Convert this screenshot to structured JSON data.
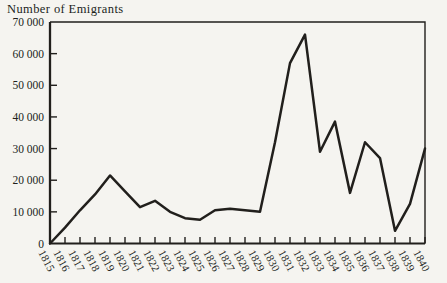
{
  "page": {
    "background": "#f5f4f0",
    "ink": "#211f1c"
  },
  "chart_data": {
    "type": "line",
    "title": "Number of Emigrants",
    "ylabel": "Number of Emigrants",
    "xlabel": "",
    "categories": [
      "1815",
      "1816",
      "1817",
      "1818",
      "1819",
      "1820",
      "1821",
      "1822",
      "1823",
      "1824",
      "1825",
      "1826",
      "1827",
      "1828",
      "1829",
      "1830",
      "1831",
      "1832",
      "1833",
      "1834",
      "1835",
      "1836",
      "1837",
      "1838",
      "1839",
      "1840"
    ],
    "values": [
      0,
      5000,
      10500,
      15500,
      21500,
      16500,
      11500,
      13500,
      10000,
      8000,
      7500,
      10500,
      11000,
      10500,
      10000,
      32000,
      57000,
      66000,
      29000,
      38500,
      16000,
      32000,
      27000,
      4000,
      12500,
      30000
    ],
    "ylim": [
      0,
      70000
    ],
    "y_ticks": [
      {
        "value": 0,
        "label": "0"
      },
      {
        "value": 10000,
        "label": "10 000"
      },
      {
        "value": 20000,
        "label": "20 000"
      },
      {
        "value": 30000,
        "label": "30 000"
      },
      {
        "value": 40000,
        "label": "40 000"
      },
      {
        "value": 50000,
        "label": "50 000"
      },
      {
        "value": 60000,
        "label": "60 000"
      },
      {
        "value": 70000,
        "label": "70 000"
      }
    ],
    "grid": false,
    "legend": "none",
    "line_color": "#211f1c",
    "line_width": 2.5,
    "x_label_rotation_deg": 62
  }
}
